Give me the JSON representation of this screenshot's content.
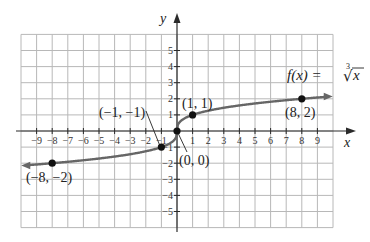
{
  "chart_data": {
    "type": "line",
    "title": "",
    "function_label": "f(x) = ∛x",
    "function_label_parts": {
      "lhs": "f(x) = ",
      "index": "3",
      "radical": "√",
      "radicand": "x"
    },
    "xlabel": "x",
    "ylabel": "y",
    "xlim": [
      -10,
      10
    ],
    "ylim": [
      -6,
      6
    ],
    "grid": true,
    "x_ticks": [
      -9,
      -8,
      -7,
      -6,
      -5,
      -4,
      -3,
      -2,
      -1,
      1,
      2,
      3,
      4,
      5,
      6,
      7,
      8,
      9
    ],
    "x_tick_labels": [
      "−9",
      "−8",
      "−7",
      "−6",
      "−5",
      "−4",
      "−3",
      "−2",
      "−1",
      "1",
      "2",
      "3",
      "4",
      "5",
      "6",
      "7",
      "8",
      "9"
    ],
    "y_ticks": [
      5,
      4,
      3,
      2,
      1,
      -1,
      -2,
      -3,
      -4,
      -5
    ],
    "y_tick_labels": [
      "5",
      "4",
      "3",
      "2",
      "1",
      "−1",
      "−2",
      "−3",
      "−4",
      "−5"
    ],
    "series": [
      {
        "name": "f(x) = ∛x",
        "x": [
          -9.5,
          -8,
          -6,
          -4,
          -2,
          -1,
          -0.5,
          -0.1,
          0,
          0.1,
          0.5,
          1,
          2,
          4,
          6,
          8,
          9.5
        ],
        "values": [
          -2.12,
          -2,
          -1.82,
          -1.59,
          -1.26,
          -1,
          -0.79,
          -0.46,
          0,
          0.46,
          0.79,
          1,
          1.26,
          1.59,
          1.82,
          2,
          2.12
        ]
      }
    ],
    "labeled_points": [
      {
        "x": -8,
        "y": -2,
        "label": "(−8, −2)"
      },
      {
        "x": -1,
        "y": -1,
        "label": "(−1, −1)"
      },
      {
        "x": 0,
        "y": 0,
        "label": "(0, 0)"
      },
      {
        "x": 1,
        "y": 1,
        "label": "(1, 1)"
      },
      {
        "x": 8,
        "y": 2,
        "label": "(8, 2)"
      }
    ]
  }
}
